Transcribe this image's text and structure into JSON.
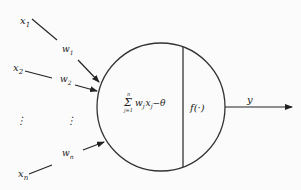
{
  "diagram": {
    "inputs": [
      {
        "x_label": "x",
        "x_sub": "1",
        "w_label": "w",
        "w_sub": "1"
      },
      {
        "x_label": "x",
        "x_sub": "2",
        "w_label": "w",
        "w_sub": "2"
      },
      {
        "x_label": "⋮",
        "x_sub": "",
        "w_label": "⋮",
        "w_sub": ""
      },
      {
        "x_label": "x",
        "x_sub": "n",
        "w_label": "w",
        "w_sub": "n"
      }
    ],
    "summation": {
      "sigma": "Σ",
      "upper": "n",
      "lower": "j=1",
      "term": "w",
      "term_sub": "j",
      "term2": "x",
      "term2_sub": "j",
      "minus_theta": "−θ"
    },
    "activation": "f(·)",
    "output": "y",
    "colors": {
      "line": "#222222",
      "background": "#fbfbfb"
    }
  }
}
